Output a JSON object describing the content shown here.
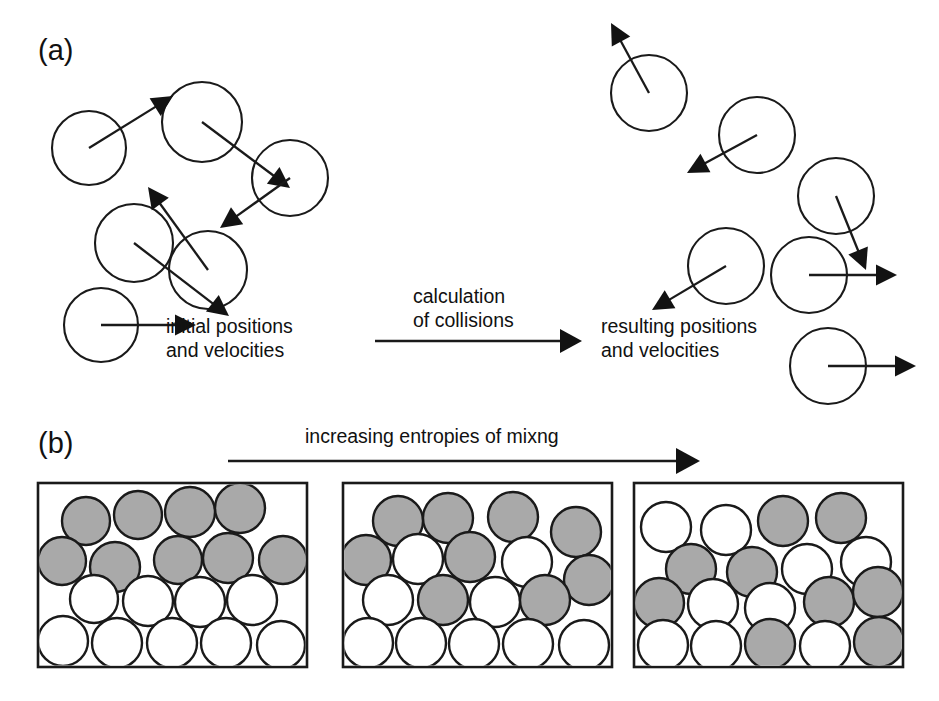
{
  "figure": {
    "background_color": "#ffffff",
    "ink_color": "#1a1a1a",
    "gray_fill": "#a9a9a9",
    "white_fill": "#ffffff",
    "width": 939,
    "height": 701
  },
  "panel_a": {
    "label": "(a)",
    "label_x": 38,
    "label_y": 60,
    "left_caption_line1": "initial positions",
    "left_caption_line2": "and velocities",
    "left_caption_x": 166,
    "left_caption_y": 333,
    "process_line1": "calculation",
    "process_line2": "of collisions",
    "process_x": 413,
    "process_y": 303,
    "right_caption_line1": "resulting positions",
    "right_caption_line2": "and velocities",
    "right_caption_x": 601,
    "right_caption_y": 333,
    "transition_arrow": {
      "x1": 375,
      "y1": 341,
      "x2": 582,
      "y2": 341
    },
    "left_particles": [
      {
        "id": "a-left-1",
        "cx": 89,
        "cy": 148,
        "r": 37,
        "vx": 84,
        "vy": -52,
        "tail_from_center": true
      },
      {
        "id": "a-left-2",
        "cx": 202,
        "cy": 122,
        "r": 40,
        "vx": 88,
        "vy": 66,
        "tail_from_center": true
      },
      {
        "id": "a-left-3",
        "cx": 290,
        "cy": 178,
        "r": 38,
        "vx": -70,
        "vy": 50,
        "tail_from_center": true
      },
      {
        "id": "a-left-4",
        "cx": 134,
        "cy": 243,
        "r": 39,
        "vx": 95,
        "vy": 73,
        "tail_from_center": true
      },
      {
        "id": "a-left-5",
        "cx": 208,
        "cy": 270,
        "r": 39,
        "vx": -60,
        "vy": -83,
        "tail_from_center": true
      },
      {
        "id": "a-left-6",
        "cx": 101,
        "cy": 325,
        "r": 37,
        "vx": 95,
        "vy": 0,
        "tail_from_center": true
      }
    ],
    "right_particles": [
      {
        "id": "a-right-1",
        "cx": 649,
        "cy": 93,
        "r": 38,
        "vx": -38,
        "vy": -70,
        "tail_from_center": true
      },
      {
        "id": "a-right-2",
        "cx": 757,
        "cy": 135,
        "r": 38,
        "vx": -70,
        "vy": 38,
        "tail_from_center": true
      },
      {
        "id": "a-right-3",
        "cx": 836,
        "cy": 196,
        "r": 38,
        "vx": 30,
        "vy": 74,
        "tail_from_center": true
      },
      {
        "id": "a-right-4",
        "cx": 726,
        "cy": 266,
        "r": 38,
        "vx": -74,
        "vy": 44,
        "tail_from_center": true
      },
      {
        "id": "a-right-5",
        "cx": 809,
        "cy": 275,
        "r": 38,
        "vx": 88,
        "vy": 0,
        "tail_from_center": true
      },
      {
        "id": "a-right-6",
        "cx": 828,
        "cy": 366,
        "r": 38,
        "vx": 88,
        "vy": 0,
        "tail_from_center": true
      }
    ]
  },
  "panel_b": {
    "label": "(b)",
    "label_x": 38,
    "label_y": 453,
    "header_text": "increasing entropies of mixng",
    "header_x": 305,
    "header_y": 443,
    "arrow": {
      "x1": 228,
      "y1": 461,
      "x2": 700,
      "y2": 461
    },
    "boxes": [
      {
        "id": "box-segregated",
        "x": 38,
        "y": 483,
        "width": 269,
        "height": 184,
        "state": "segregated",
        "spheres": [
          {
            "cx": 86,
            "cy": 521,
            "r": 24,
            "color": "gray"
          },
          {
            "cx": 138,
            "cy": 515,
            "r": 24,
            "color": "gray"
          },
          {
            "cx": 190,
            "cy": 512,
            "r": 25,
            "color": "gray"
          },
          {
            "cx": 240,
            "cy": 508,
            "r": 25,
            "color": "gray"
          },
          {
            "cx": 62,
            "cy": 561,
            "r": 24,
            "color": "gray"
          },
          {
            "cx": 115,
            "cy": 567,
            "r": 25,
            "color": "gray"
          },
          {
            "cx": 178,
            "cy": 560,
            "r": 24,
            "color": "gray"
          },
          {
            "cx": 228,
            "cy": 558,
            "r": 25,
            "color": "gray"
          },
          {
            "cx": 283,
            "cy": 560,
            "r": 24,
            "color": "gray"
          },
          {
            "cx": 94,
            "cy": 599,
            "r": 24,
            "color": "white"
          },
          {
            "cx": 148,
            "cy": 601,
            "r": 25,
            "color": "white"
          },
          {
            "cx": 200,
            "cy": 602,
            "r": 25,
            "color": "white"
          },
          {
            "cx": 252,
            "cy": 600,
            "r": 25,
            "color": "white"
          },
          {
            "cx": 63,
            "cy": 641,
            "r": 25,
            "color": "white"
          },
          {
            "cx": 117,
            "cy": 643,
            "r": 25,
            "color": "white"
          },
          {
            "cx": 172,
            "cy": 643,
            "r": 25,
            "color": "white"
          },
          {
            "cx": 226,
            "cy": 643,
            "r": 25,
            "color": "white"
          },
          {
            "cx": 281,
            "cy": 645,
            "r": 24,
            "color": "white"
          }
        ]
      },
      {
        "id": "box-partial",
        "x": 343,
        "y": 483,
        "width": 269,
        "height": 184,
        "state": "partially-mixed",
        "spheres": [
          {
            "cx": 398,
            "cy": 521,
            "r": 25,
            "color": "gray"
          },
          {
            "cx": 448,
            "cy": 518,
            "r": 25,
            "color": "gray"
          },
          {
            "cx": 513,
            "cy": 517,
            "r": 25,
            "color": "gray"
          },
          {
            "cx": 576,
            "cy": 532,
            "r": 25,
            "color": "gray"
          },
          {
            "cx": 366,
            "cy": 560,
            "r": 25,
            "color": "gray"
          },
          {
            "cx": 418,
            "cy": 559,
            "r": 25,
            "color": "white"
          },
          {
            "cx": 470,
            "cy": 557,
            "r": 25,
            "color": "gray"
          },
          {
            "cx": 527,
            "cy": 562,
            "r": 25,
            "color": "white"
          },
          {
            "cx": 589,
            "cy": 580,
            "r": 25,
            "color": "gray"
          },
          {
            "cx": 388,
            "cy": 600,
            "r": 25,
            "color": "white"
          },
          {
            "cx": 443,
            "cy": 600,
            "r": 25,
            "color": "gray"
          },
          {
            "cx": 495,
            "cy": 602,
            "r": 25,
            "color": "white"
          },
          {
            "cx": 545,
            "cy": 600,
            "r": 25,
            "color": "gray"
          },
          {
            "cx": 368,
            "cy": 643,
            "r": 25,
            "color": "white"
          },
          {
            "cx": 421,
            "cy": 643,
            "r": 25,
            "color": "white"
          },
          {
            "cx": 474,
            "cy": 644,
            "r": 25,
            "color": "white"
          },
          {
            "cx": 528,
            "cy": 644,
            "r": 25,
            "color": "white"
          },
          {
            "cx": 584,
            "cy": 645,
            "r": 25,
            "color": "white"
          }
        ]
      },
      {
        "id": "box-mixed",
        "x": 634,
        "y": 483,
        "width": 269,
        "height": 184,
        "state": "well-mixed",
        "spheres": [
          {
            "cx": 666,
            "cy": 527,
            "r": 25,
            "color": "white"
          },
          {
            "cx": 726,
            "cy": 530,
            "r": 25,
            "color": "white"
          },
          {
            "cx": 783,
            "cy": 521,
            "r": 25,
            "color": "gray"
          },
          {
            "cx": 841,
            "cy": 518,
            "r": 25,
            "color": "gray"
          },
          {
            "cx": 691,
            "cy": 569,
            "r": 25,
            "color": "gray"
          },
          {
            "cx": 752,
            "cy": 572,
            "r": 25,
            "color": "gray"
          },
          {
            "cx": 807,
            "cy": 569,
            "r": 25,
            "color": "white"
          },
          {
            "cx": 866,
            "cy": 562,
            "r": 25,
            "color": "white"
          },
          {
            "cx": 659,
            "cy": 603,
            "r": 25,
            "color": "gray"
          },
          {
            "cx": 713,
            "cy": 604,
            "r": 25,
            "color": "white"
          },
          {
            "cx": 770,
            "cy": 608,
            "r": 25,
            "color": "white"
          },
          {
            "cx": 829,
            "cy": 602,
            "r": 25,
            "color": "gray"
          },
          {
            "cx": 878,
            "cy": 592,
            "r": 25,
            "color": "gray"
          },
          {
            "cx": 663,
            "cy": 645,
            "r": 25,
            "color": "white"
          },
          {
            "cx": 716,
            "cy": 646,
            "r": 25,
            "color": "white"
          },
          {
            "cx": 770,
            "cy": 644,
            "r": 25,
            "color": "gray"
          },
          {
            "cx": 825,
            "cy": 646,
            "r": 25,
            "color": "white"
          },
          {
            "cx": 879,
            "cy": 642,
            "r": 25,
            "color": "gray"
          }
        ]
      }
    ]
  }
}
